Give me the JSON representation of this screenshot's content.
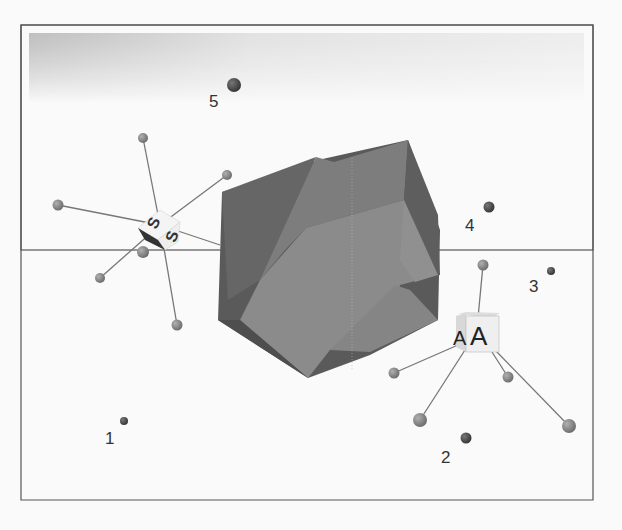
{
  "figure": {
    "type": "3D coordination geometry diagram",
    "points": [
      {
        "id": "point-1",
        "label": "1"
      },
      {
        "id": "point-2",
        "label": "2"
      },
      {
        "id": "point-3",
        "label": "3"
      },
      {
        "id": "point-4",
        "label": "4"
      },
      {
        "id": "point-5",
        "label": "5"
      }
    ],
    "cubes": [
      {
        "id": "cube-s",
        "face_labels": [
          "S",
          "S"
        ],
        "ligand_count": 6
      },
      {
        "id": "cube-a",
        "face_labels": [
          "A",
          "A"
        ],
        "ligand_count": 5
      }
    ],
    "colors": {
      "background": "#fafafa",
      "frame": "#555555",
      "polyhedron_light": "#8c8c8c",
      "polyhedron_mid": "#7a7a7a",
      "polyhedron_dark": "#555555",
      "sphere": "#8a8a8a",
      "point_dark": "#444444",
      "bond": "#777777"
    }
  }
}
